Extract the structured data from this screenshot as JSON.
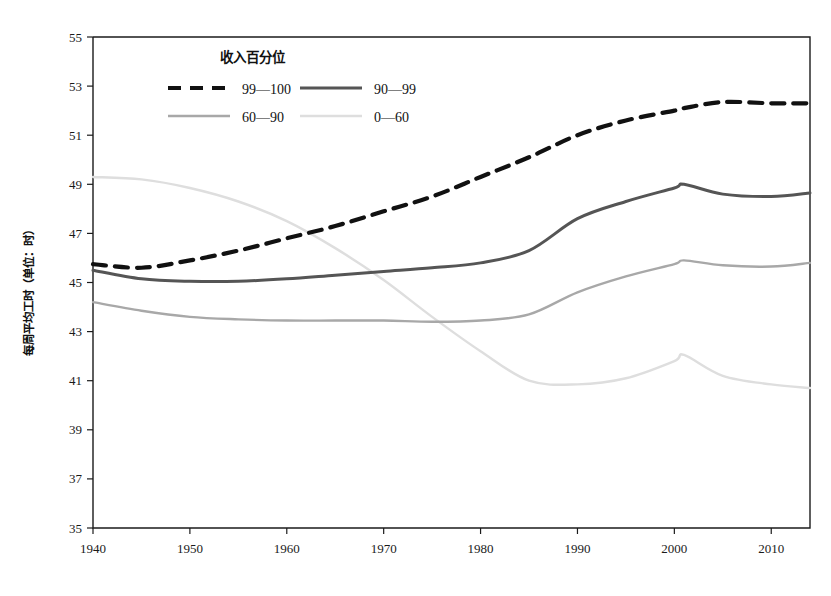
{
  "chart_data": {
    "type": "line",
    "title": "",
    "xlabel": "",
    "ylabel": "每周平均工时（单位：时）",
    "legend_title": "收入百分位",
    "legend_position": "top-left-inside",
    "grid": false,
    "xlim": [
      1940,
      2014
    ],
    "ylim": [
      35,
      55
    ],
    "xticks": [
      1940,
      1950,
      1960,
      1970,
      1980,
      1990,
      2000,
      2010
    ],
    "xtick_labels": [
      "1940",
      "1950",
      "1960",
      "1970",
      "1980",
      "1990",
      "2000",
      "2010"
    ],
    "yticks": [
      35,
      37,
      39,
      41,
      43,
      45,
      47,
      49,
      51,
      53,
      55
    ],
    "ytick_labels": [
      "35",
      "37",
      "39",
      "41",
      "43",
      "45",
      "47",
      "49",
      "51",
      "53",
      "55"
    ],
    "x": [
      1940,
      1945,
      1950,
      1955,
      1960,
      1965,
      1970,
      1975,
      1980,
      1985,
      1990,
      1995,
      2000,
      2001,
      2005,
      2010,
      2014
    ],
    "series": [
      {
        "name": "99—100",
        "label": "99—100",
        "color": "#111111",
        "style": "dashed",
        "width": 4.2,
        "values": [
          45.75,
          45.6,
          45.9,
          46.3,
          46.8,
          47.3,
          47.9,
          48.5,
          49.3,
          50.1,
          51.0,
          51.6,
          52.0,
          52.1,
          52.35,
          52.3,
          52.3
        ]
      },
      {
        "name": "90—99",
        "label": "90—99",
        "color": "#555555",
        "style": "solid",
        "width": 3.0,
        "values": [
          45.5,
          45.15,
          45.05,
          45.05,
          45.15,
          45.3,
          45.45,
          45.6,
          45.8,
          46.3,
          47.6,
          48.3,
          48.85,
          49.0,
          48.6,
          48.5,
          48.65
        ]
      },
      {
        "name": "60—90",
        "label": "60—90",
        "color": "#a8a8a8",
        "style": "solid",
        "width": 2.4,
        "values": [
          44.2,
          43.85,
          43.6,
          43.5,
          43.45,
          43.45,
          43.45,
          43.4,
          43.45,
          43.7,
          44.6,
          45.25,
          45.75,
          45.9,
          45.7,
          45.65,
          45.8
        ]
      },
      {
        "name": "0—60",
        "label": "0—60",
        "color": "#dedede",
        "style": "solid",
        "width": 2.4,
        "values": [
          49.3,
          49.2,
          48.85,
          48.3,
          47.5,
          46.4,
          45.1,
          43.6,
          42.2,
          41.0,
          40.85,
          41.1,
          41.8,
          42.05,
          41.2,
          40.85,
          40.7
        ]
      }
    ]
  }
}
